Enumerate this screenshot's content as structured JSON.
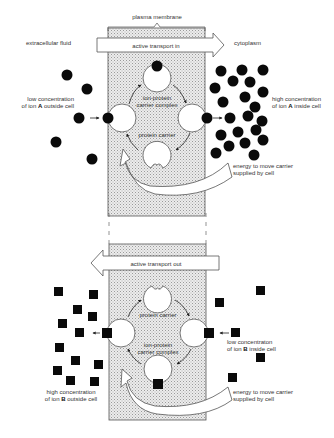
{
  "labels": {
    "plasma_membrane": "plasma membrane",
    "extracellular_fluid": "extracellular fluid",
    "cytoplasm": "cytoplasm",
    "active_transport_in": "active transport in",
    "active_transport_out": "active transport out",
    "top": {
      "low_conc_line1": "low concentration",
      "low_conc_line2_pre": "of ion ",
      "low_conc_ion": "A",
      "low_conc_line2_post": " outside cell",
      "high_conc_line1": "high concentration",
      "high_conc_line2_pre": "of ion ",
      "high_conc_ion": "A",
      "high_conc_line2_post": " inside cell",
      "complex_line1": "ion-protein",
      "complex_line2": "carrier complex",
      "carrier": "protein carrier",
      "energy_line1": "energy to move carrier",
      "energy_line2": "supplied by cell"
    },
    "bottom": {
      "low_conc_line1": "low concentraton",
      "low_conc_line2_pre": "of ion ",
      "low_conc_ion": "B",
      "low_conc_line2_post": " inside cell",
      "high_conc_line1": "high concentration",
      "high_conc_line2_pre": "of ion ",
      "high_conc_ion": "B",
      "high_conc_line2_post": " outside cell",
      "carrier": "protein carrier",
      "complex_line1": "ion-protein",
      "complex_line2": "carrier complex",
      "energy_line1": "energy to move carrier",
      "energy_line2": "supplied by cell"
    }
  },
  "colors": {
    "ion": "#0a0a0a",
    "membrane_fill": "#e4e4e4",
    "outline": "#444444",
    "text": "#333333"
  }
}
